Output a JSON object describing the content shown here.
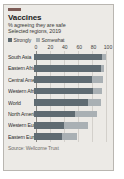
{
  "card": {
    "accent_color": "#7c5a55",
    "background": "#eceae6"
  },
  "header": {
    "title": "Vaccines",
    "subtitle": "% agreeing they are safe",
    "period": "Selected regions, 2019"
  },
  "legend": {
    "items": [
      {
        "label": "Strongly",
        "color": "#5f6b72"
      },
      {
        "label": "Somewhat",
        "color": "#a9b0b4"
      }
    ]
  },
  "source": {
    "text": "Source: Wellcome Trust"
  },
  "chart_data": {
    "type": "bar",
    "orientation": "horizontal",
    "stacked": true,
    "title": "Vaccines",
    "subtitle": "% agreeing they are safe",
    "annotation": "Selected regions, 2019",
    "xlabel": "",
    "ylabel": "",
    "xlim": [
      0,
      100
    ],
    "ticks": [
      0,
      20,
      40,
      60,
      80,
      100
    ],
    "tick_labels": [
      "0",
      "20",
      "40",
      "60",
      "80",
      "100"
    ],
    "grid": true,
    "legend_position": "top-left",
    "categories": [
      "South Asia",
      "Eastern Africa",
      "Central America",
      "Western Africa",
      "World",
      "North America",
      "Western Europe",
      "Eastern Europe"
    ],
    "series": [
      {
        "name": "Strongly",
        "color": "#5f6b72",
        "values": [
          92,
          90,
          78,
          80,
          73,
          55,
          40,
          38
        ]
      },
      {
        "name": "Somewhat",
        "color": "#a9b0b4",
        "values": [
          5,
          5,
          15,
          12,
          17,
          30,
          33,
          20
        ]
      }
    ],
    "totals": [
      97,
      95,
      93,
      92,
      90,
      85,
      73,
      58
    ],
    "source": "Source: Wellcome Trust"
  }
}
